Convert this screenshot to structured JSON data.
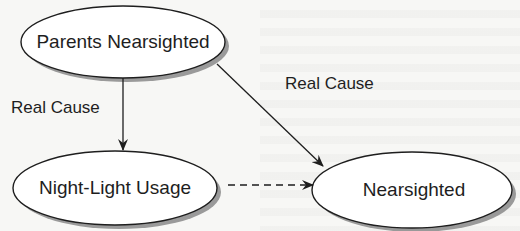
{
  "diagram": {
    "type": "causal-diagram",
    "colors": {
      "background": "#f7f7f5",
      "stroke": "#1e1e1e",
      "node_fill": "#ffffff",
      "node_shadow": "#8a8a8a"
    },
    "nodes": [
      {
        "id": "parents",
        "label": "Parents Nearsighted",
        "shape": "ellipse"
      },
      {
        "id": "nightlight",
        "label": "Night-Light Usage",
        "shape": "ellipse"
      },
      {
        "id": "nearsighted",
        "label": "Nearsighted",
        "shape": "ellipse"
      }
    ],
    "edges": [
      {
        "from": "parents",
        "to": "nightlight",
        "label": "Real Cause",
        "style": "solid"
      },
      {
        "from": "parents",
        "to": "nearsighted",
        "label": "Real Cause",
        "style": "solid"
      },
      {
        "from": "nightlight",
        "to": "nearsighted",
        "label": "",
        "style": "dashed"
      }
    ]
  }
}
